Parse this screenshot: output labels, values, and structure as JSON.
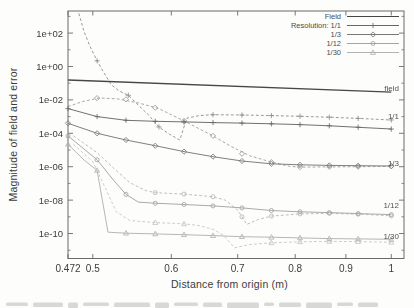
{
  "chart_data": {
    "type": "line",
    "title": "",
    "xlabel": "Distance from origin (m)",
    "ylabel": "Magnitude of field and error",
    "x_scale": "log",
    "y_scale": "log",
    "grid": false,
    "xlim": [
      0.472,
      1.03
    ],
    "ylim": [
      3.2e-12,
      2100.0
    ],
    "xticks": [
      {
        "v": 0.472,
        "label": "0.472"
      },
      {
        "v": 0.5,
        "label": "0.5"
      },
      {
        "v": 0.6,
        "label": "0.6"
      },
      {
        "v": 0.7,
        "label": "0.7"
      },
      {
        "v": 0.8,
        "label": "0.8"
      },
      {
        "v": 0.9,
        "label": "0.9"
      },
      {
        "v": 1,
        "label": "1"
      }
    ],
    "yticks": [
      {
        "v": 100.0,
        "label": "1e+02"
      },
      {
        "v": 1.0,
        "label": "1e+00"
      },
      {
        "v": 0.01,
        "label": "1e-02"
      },
      {
        "v": 0.0001,
        "label": "1e-04"
      },
      {
        "v": 1e-06,
        "label": "1e-06"
      },
      {
        "v": 1e-08,
        "label": "1e-08"
      },
      {
        "v": 1e-10,
        "label": "1e-10"
      }
    ],
    "yticks_minor": [
      1000.0,
      10.0,
      0.1,
      0.001,
      1e-05,
      1e-07,
      1e-09,
      1e-11
    ],
    "legend": {
      "position": "top-right",
      "entries": [
        {
          "label": "Field",
          "marker": "none",
          "color": "#474747"
        },
        {
          "label": "Resolution: 1/1",
          "marker": "plus",
          "color": "#686868"
        },
        {
          "label": "1/3",
          "marker": "diamond",
          "color": "#787878"
        },
        {
          "label": "1/12",
          "marker": "circle",
          "color": "#a4a4a4"
        },
        {
          "label": "1/30",
          "marker": "triangle",
          "color": "#b2b2b2"
        }
      ]
    },
    "right_labels": [
      {
        "text": "field",
        "value": 0.055
      },
      {
        "text": "1/1",
        "value": 0.00105
      },
      {
        "text": "1/3",
        "value": 1.7e-06
      },
      {
        "text": "1/12",
        "value": 5.2e-09
      },
      {
        "text": "1/30",
        "value": 7.5e-11
      }
    ],
    "series": [
      {
        "name": "field",
        "role": "field-magnitude",
        "marker": "none",
        "dash": false,
        "color": "#474747",
        "width": 1.4,
        "points": [
          [
            0.472,
            0.155
          ],
          [
            1.0,
            0.0295
          ]
        ]
      },
      {
        "name": "res-1-1-error",
        "role": "actual-error",
        "marker": "plus",
        "dash": false,
        "color": "#686868",
        "width": 0.95,
        "points": [
          [
            0.472,
            0.003
          ],
          [
            0.505,
            0.001
          ],
          [
            0.54,
            0.0006
          ],
          [
            0.578,
            0.00052
          ],
          [
            0.618,
            0.00048
          ],
          [
            0.661,
            0.00044
          ],
          [
            0.707,
            0.00041
          ],
          [
            0.757,
            0.00037
          ],
          [
            0.809,
            0.00033
          ],
          [
            0.866,
            0.00028
          ],
          [
            0.926,
            0.00023
          ],
          [
            1.0,
            0.00018
          ]
        ]
      },
      {
        "name": "res-1-1-estimate",
        "role": "estimated-error",
        "marker": "plus",
        "dash": true,
        "color": "#8d8d8d",
        "width": 0.9,
        "points": [
          [
            0.484,
            1500
          ],
          [
            0.49,
            120
          ],
          [
            0.497,
            15
          ],
          [
            0.505,
            2.2
          ],
          [
            0.514,
            0.35
          ],
          [
            0.522,
            0.08
          ],
          [
            0.532,
            0.033
          ],
          [
            0.543,
            0.019
          ],
          [
            0.556,
            0.0047
          ],
          [
            0.569,
            0.00126
          ],
          [
            0.583,
            0.00024
          ],
          [
            0.597,
            9e-05
          ],
          [
            0.612,
            4e-05
          ],
          [
            0.622,
            0.0008
          ],
          [
            0.64,
            0.00115
          ],
          [
            0.661,
            0.0013
          ],
          [
            0.707,
            0.00125
          ],
          [
            0.757,
            0.00115
          ],
          [
            0.809,
            0.00105
          ],
          [
            0.866,
            0.00092
          ],
          [
            0.926,
            0.00078
          ],
          [
            1.0,
            0.00063
          ]
        ],
        "marker_points": [
          [
            0.505,
            2.2
          ],
          [
            0.543,
            0.019
          ],
          [
            0.583,
            0.00024
          ],
          [
            0.661,
            0.0013
          ],
          [
            0.707,
            0.00125
          ],
          [
            0.757,
            0.00115
          ],
          [
            0.809,
            0.00105
          ],
          [
            0.866,
            0.00092
          ],
          [
            0.926,
            0.00078
          ],
          [
            1.0,
            0.00063
          ]
        ]
      },
      {
        "name": "res-1-3-error",
        "role": "actual-error",
        "marker": "diamond",
        "dash": false,
        "color": "#787878",
        "width": 0.95,
        "points": [
          [
            0.472,
            0.0004
          ],
          [
            0.505,
            0.0001
          ],
          [
            0.54,
            4e-05
          ],
          [
            0.578,
            1.8e-05
          ],
          [
            0.618,
            8e-06
          ],
          [
            0.661,
            4e-06
          ],
          [
            0.707,
            2.2e-06
          ],
          [
            0.757,
            1.5e-06
          ],
          [
            0.809,
            1.3e-06
          ],
          [
            0.866,
            1.2e-06
          ],
          [
            0.926,
            1.15e-06
          ],
          [
            1.0,
            1.1e-06
          ]
        ]
      },
      {
        "name": "res-1-3-estimate",
        "role": "estimated-error",
        "marker": "diamond",
        "dash": true,
        "color": "#9c9c9c",
        "width": 0.9,
        "points": [
          [
            0.472,
            0.004
          ],
          [
            0.49,
            0.0085
          ],
          [
            0.508,
            0.013
          ],
          [
            0.53,
            0.0115
          ],
          [
            0.556,
            0.0066
          ],
          [
            0.583,
            0.003
          ],
          [
            0.6,
            0.0013
          ],
          [
            0.618,
            0.00055
          ],
          [
            0.64,
            0.00019
          ],
          [
            0.661,
            7e-05
          ],
          [
            0.69,
            1.6e-05
          ],
          [
            0.72,
            4.5e-06
          ],
          [
            0.757,
            1.9e-06
          ],
          [
            0.79,
            1.05e-06
          ],
          [
            0.809,
            9.5e-07
          ],
          [
            0.866,
            9.8e-07
          ],
          [
            0.926,
            1e-06
          ],
          [
            1.0,
            1.05e-06
          ]
        ],
        "marker_points": [
          [
            0.505,
            0.0128
          ],
          [
            0.54,
            0.0108
          ],
          [
            0.578,
            0.0034
          ],
          [
            0.618,
            0.00055
          ],
          [
            0.661,
            7e-05
          ],
          [
            0.707,
            6e-06
          ],
          [
            0.757,
            1.9e-06
          ],
          [
            0.809,
            9.5e-07
          ],
          [
            0.866,
            9.8e-07
          ],
          [
            0.926,
            1e-06
          ],
          [
            1.0,
            1.05e-06
          ]
        ]
      },
      {
        "name": "res-1-12-error",
        "role": "actual-error",
        "marker": "circle",
        "dash": false,
        "color": "#a4a4a4",
        "width": 0.95,
        "points": [
          [
            0.472,
            7e-05
          ],
          [
            0.505,
            2.6e-06
          ],
          [
            0.525,
            1.5e-07
          ],
          [
            0.54,
            2.2e-08
          ],
          [
            0.556,
            7.5e-09
          ],
          [
            0.578,
            6.5e-09
          ],
          [
            0.618,
            5.5e-09
          ],
          [
            0.661,
            4.5e-09
          ],
          [
            0.707,
            3.4e-09
          ],
          [
            0.757,
            2.4e-09
          ],
          [
            0.809,
            2e-09
          ],
          [
            0.866,
            1.8e-09
          ],
          [
            0.926,
            1.55e-09
          ],
          [
            1.0,
            1.35e-09
          ]
        ],
        "marker_points": [
          [
            0.472,
            7e-05
          ],
          [
            0.505,
            2.6e-06
          ],
          [
            0.54,
            2.2e-08
          ],
          [
            0.578,
            6.5e-09
          ],
          [
            0.618,
            5.5e-09
          ],
          [
            0.661,
            4.5e-09
          ],
          [
            0.707,
            3.4e-09
          ],
          [
            0.757,
            2.4e-09
          ],
          [
            0.809,
            2e-09
          ],
          [
            0.866,
            1.8e-09
          ],
          [
            0.926,
            1.55e-09
          ],
          [
            1.0,
            1.35e-09
          ]
        ]
      },
      {
        "name": "res-1-12-estimate",
        "role": "estimated-error",
        "marker": "circle",
        "dash": true,
        "color": "#b7b7b7",
        "width": 0.9,
        "points": [
          [
            0.478,
            7e-05
          ],
          [
            0.505,
            7e-06
          ],
          [
            0.525,
            8e-07
          ],
          [
            0.545,
            1.1e-07
          ],
          [
            0.565,
            3.8e-08
          ],
          [
            0.578,
            2.8e-08
          ],
          [
            0.618,
            2.3e-08
          ],
          [
            0.661,
            1.6e-08
          ],
          [
            0.68,
            1e-08
          ],
          [
            0.7,
            2.5e-09
          ],
          [
            0.715,
            3.5e-10
          ],
          [
            0.735,
            7e-10
          ],
          [
            0.757,
            1.1e-09
          ],
          [
            0.809,
            1.5e-09
          ],
          [
            0.866,
            1.6e-09
          ],
          [
            0.926,
            1.45e-09
          ],
          [
            1.0,
            1.15e-09
          ]
        ],
        "marker_points": [
          [
            0.578,
            2.8e-08
          ],
          [
            0.618,
            2.3e-08
          ],
          [
            0.661,
            1.6e-08
          ],
          [
            0.707,
            1e-09
          ],
          [
            0.757,
            1.1e-09
          ],
          [
            0.809,
            1.5e-09
          ],
          [
            0.866,
            1.6e-09
          ],
          [
            0.926,
            1.45e-09
          ],
          [
            1.0,
            1.15e-09
          ]
        ]
      },
      {
        "name": "res-1-30-error",
        "role": "actual-error",
        "marker": "triangle",
        "dash": false,
        "color": "#b2b2b2",
        "width": 0.95,
        "points": [
          [
            0.472,
            2.2e-05
          ],
          [
            0.49,
            2.5e-06
          ],
          [
            0.505,
            6e-07
          ],
          [
            0.518,
            1.2e-10
          ],
          [
            0.54,
            1.05e-10
          ],
          [
            0.578,
            9.5e-11
          ],
          [
            0.618,
            8.5e-11
          ],
          [
            0.661,
            7.5e-11
          ],
          [
            0.707,
            6.5e-11
          ],
          [
            0.757,
            6e-11
          ],
          [
            0.809,
            5.5e-11
          ],
          [
            0.866,
            5e-11
          ],
          [
            0.926,
            4.8e-11
          ],
          [
            1.0,
            4.5e-11
          ]
        ],
        "marker_points": [
          [
            0.472,
            2.2e-05
          ],
          [
            0.505,
            6e-07
          ],
          [
            0.54,
            1.05e-10
          ],
          [
            0.578,
            9.5e-11
          ],
          [
            0.618,
            8.5e-11
          ],
          [
            0.661,
            7.5e-11
          ],
          [
            0.707,
            6.5e-11
          ],
          [
            0.757,
            6e-11
          ],
          [
            0.809,
            5.5e-11
          ],
          [
            0.866,
            5e-11
          ],
          [
            0.926,
            4.8e-11
          ],
          [
            1.0,
            4.5e-11
          ]
        ]
      },
      {
        "name": "res-1-30-estimate",
        "role": "estimated-error",
        "marker": "triangle",
        "dash": true,
        "color": "#c5c5c5",
        "width": 0.9,
        "points": [
          [
            0.478,
            2.2e-05
          ],
          [
            0.5,
            2e-06
          ],
          [
            0.515,
            5e-08
          ],
          [
            0.528,
            2e-09
          ],
          [
            0.545,
            6e-10
          ],
          [
            0.578,
            4.5e-10
          ],
          [
            0.618,
            3.8e-10
          ],
          [
            0.64,
            3e-10
          ],
          [
            0.661,
            1.8e-10
          ],
          [
            0.677,
            8e-11
          ],
          [
            0.695,
            1.4e-11
          ],
          [
            0.72,
            2.2e-11
          ],
          [
            0.757,
            2.8e-11
          ],
          [
            0.809,
            3.2e-11
          ],
          [
            0.866,
            3.4e-11
          ],
          [
            0.926,
            3.3e-11
          ],
          [
            1.0,
            3e-11
          ]
        ],
        "marker_points": [
          [
            0.578,
            4.5e-10
          ],
          [
            0.618,
            3.8e-10
          ],
          [
            0.757,
            2.8e-11
          ],
          [
            0.809,
            3.2e-11
          ],
          [
            0.866,
            3.4e-11
          ],
          [
            0.926,
            3.3e-11
          ],
          [
            1.0,
            3e-11
          ]
        ]
      }
    ]
  },
  "decor": {
    "caption_remnant": true,
    "caption_blob_widths": [
      22,
      30,
      10,
      26,
      36,
      14,
      24,
      19,
      32,
      10,
      22,
      26,
      16,
      20
    ]
  },
  "colors": {
    "background": "#fdfdfb",
    "axis": "#6a6a6a",
    "tick_text": "#3c3c3c",
    "annotation_text": "#525252"
  }
}
